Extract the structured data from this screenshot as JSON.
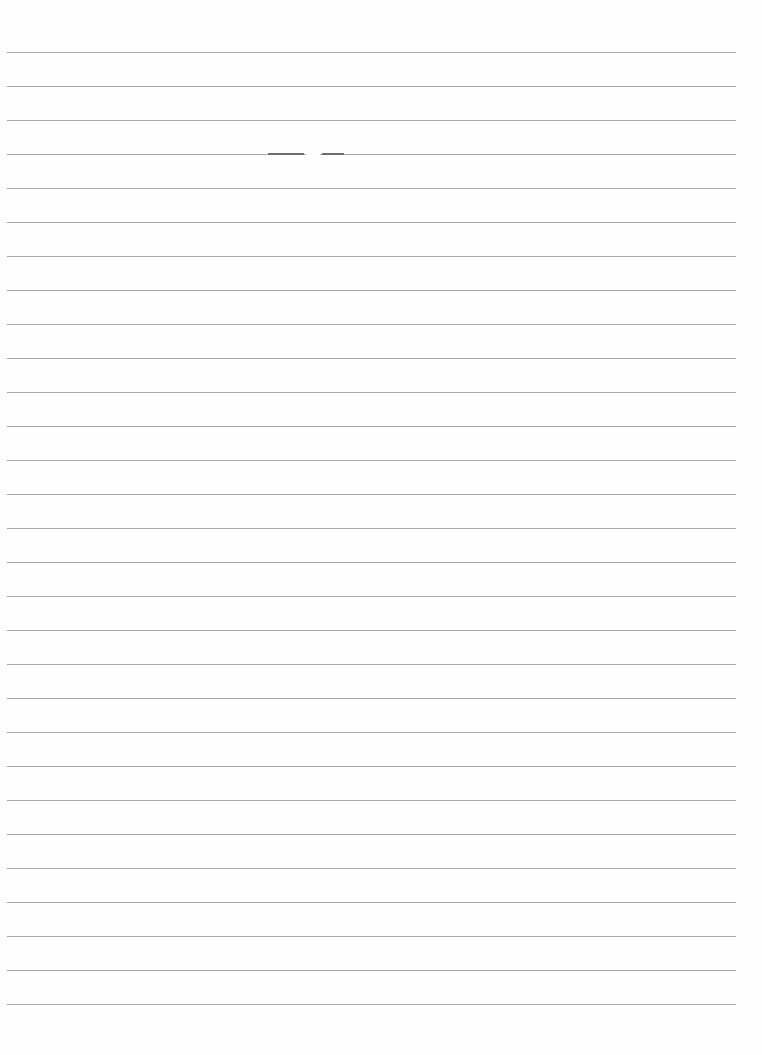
{
  "page": {
    "type": "blank lined paper",
    "text": "",
    "line_count": 29,
    "first_line_y": 52,
    "line_spacing": 34,
    "line_left_x": 7,
    "line_right_x": 736,
    "line_color": "#9a9a9a",
    "background_color": "#fefefe"
  }
}
